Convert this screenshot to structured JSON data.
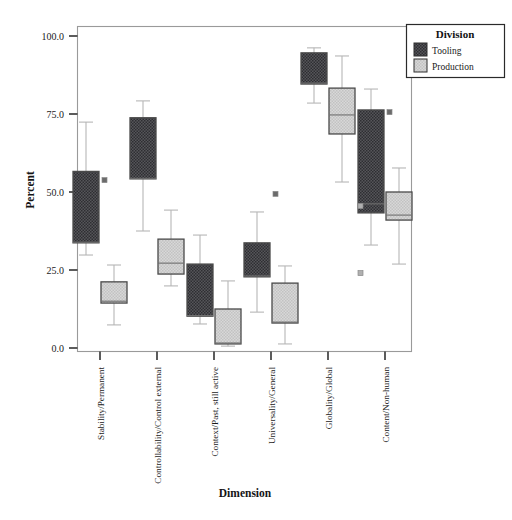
{
  "chart_data": {
    "type": "box",
    "title": "",
    "xlabel": "Dimension",
    "ylabel": "Percent",
    "ylim": [
      0.0,
      100.0
    ],
    "yticks": [
      0.0,
      25.0,
      50.0,
      75.0,
      100.0
    ],
    "ytick_labels": [
      "0.0",
      "25.0",
      "50.0",
      "75.0",
      "100.0"
    ],
    "grid": false,
    "legend": {
      "title": "Division",
      "position": "top-right-outside",
      "entries": [
        {
          "name": "Tooling",
          "color": "#4a4a4a"
        },
        {
          "name": "Production",
          "color": "#c8c8c8"
        }
      ]
    },
    "categories": [
      "Stability/Permanent",
      "Controllability/Control external",
      "Context/Past, still active",
      "Universality/General",
      "Globality/Global",
      "Content/Non-human"
    ],
    "series": [
      {
        "name": "Tooling",
        "color": "#4a4a4a",
        "boxes": [
          {
            "category": "Stability/Permanent",
            "whisker_low": 29.8,
            "q1": 33.7,
            "median": 33.9,
            "q3": 56.6,
            "whisker_high": 72.4,
            "outliers": [
              53.8
            ]
          },
          {
            "category": "Controllability/Control external",
            "whisker_low": 37.5,
            "q1": 54.2,
            "median": 54.4,
            "q3": 73.8,
            "whisker_high": 79.2,
            "outliers": []
          },
          {
            "category": "Context/Past, still active",
            "whisker_low": 7.7,
            "q1": 10.2,
            "median": 10.4,
            "q3": 26.9,
            "whisker_high": 36.2,
            "outliers": []
          },
          {
            "category": "Universality/General",
            "whisker_low": 11.5,
            "q1": 22.8,
            "median": 23.1,
            "q3": 33.7,
            "whisker_high": 43.6,
            "outliers": [
              49.4
            ]
          },
          {
            "category": "Globality/Global",
            "whisker_low": 78.5,
            "q1": 84.6,
            "median": 84.9,
            "q3": 94.6,
            "whisker_high": 96.2,
            "outliers": []
          },
          {
            "category": "Content/Non-human",
            "whisker_low": 33.0,
            "q1": 43.3,
            "median": 46.2,
            "q3": 76.3,
            "whisker_high": 83.0,
            "outliers": [
              75.6
            ]
          }
        ]
      },
      {
        "name": "Production",
        "color": "#c8c8c8",
        "boxes": [
          {
            "category": "Stability/Permanent",
            "whisker_low": 7.4,
            "q1": 14.4,
            "median": 15.0,
            "q3": 21.2,
            "whisker_high": 26.6,
            "outliers": []
          },
          {
            "category": "Controllability/Control external",
            "whisker_low": 19.9,
            "q1": 23.7,
            "median": 27.2,
            "q3": 34.9,
            "whisker_high": 44.2,
            "outliers": []
          },
          {
            "category": "Context/Past, still active",
            "whisker_low": 0.6,
            "q1": 1.3,
            "median": 1.6,
            "q3": 12.5,
            "whisker_high": 21.5,
            "outliers": []
          },
          {
            "category": "Universality/General",
            "whisker_low": 1.3,
            "q1": 8.0,
            "median": 8.3,
            "q3": 20.8,
            "whisker_high": 26.3,
            "outliers": []
          },
          {
            "category": "Globality/Global",
            "whisker_low": 53.2,
            "q1": 68.6,
            "median": 74.7,
            "q3": 83.3,
            "whisker_high": 93.6,
            "outliers": [
              45.5,
              24.0
            ]
          },
          {
            "category": "Content/Non-human",
            "whisker_low": 26.9,
            "q1": 41.0,
            "median": 42.6,
            "q3": 50.0,
            "whisker_high": 57.7,
            "outliers": []
          }
        ]
      }
    ]
  }
}
